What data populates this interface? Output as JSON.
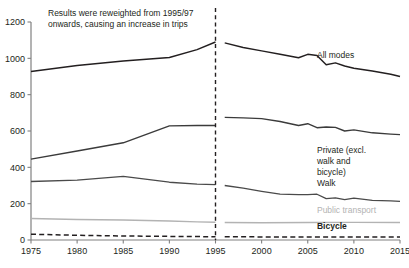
{
  "chart_data": {
    "type": "line",
    "title": "",
    "xlabel": "",
    "ylabel": "",
    "xlim": [
      1975,
      2015
    ],
    "ylim": [
      0,
      1200
    ],
    "grid": false,
    "legend_position": "inline-right",
    "yticks": [
      0,
      200,
      400,
      600,
      800,
      1000,
      1200
    ],
    "xticks": [
      1975,
      1980,
      1985,
      1990,
      1995,
      2000,
      2005,
      2010,
      2015
    ],
    "annotations": [
      {
        "name": "reweight-note",
        "line1": "Results were reweighted from 1995/97",
        "line2": "onwards, causing an increase in trips"
      },
      {
        "name": "series-break",
        "at_x": 1995,
        "style": "dashed-vertical"
      }
    ],
    "series": [
      {
        "name": "All modes",
        "color": "#231f20",
        "width": 1.5,
        "dash": "",
        "label_x": 2006,
        "label_y": 1000,
        "segments": [
          {
            "part": "pre",
            "x": [
              1975,
              1980,
              1985,
              1990,
              1993,
              1995
            ],
            "values": [
              928,
              960,
              985,
              1005,
              1048,
              1090
            ]
          },
          {
            "part": "post",
            "x": [
              1996,
              1998,
              2000,
              2002,
              2004,
              2005,
              2006,
              2007,
              2008,
              2009,
              2010,
              2012,
              2014,
              2015
            ],
            "values": [
              1085,
              1060,
              1041,
              1022,
              1003,
              1022,
              1016,
              965,
              975,
              958,
              945,
              930,
              912,
              900
            ]
          }
        ]
      },
      {
        "name": "Private (excl. walk and bicycle)",
        "color": "#3b3b3b",
        "width": 1.4,
        "dash": "",
        "label_x": 2006,
        "label_y": 480,
        "label_lines": [
          "Private (excl.",
          "walk and",
          "bicycle)"
        ],
        "segments": [
          {
            "part": "pre",
            "x": [
              1975,
              1980,
              1985,
              1990,
              1993,
              1995
            ],
            "values": [
              445,
              490,
              535,
              628,
              630,
              630
            ]
          },
          {
            "part": "post",
            "x": [
              1996,
              1998,
              2000,
              2002,
              2004,
              2005,
              2006,
              2007,
              2008,
              2009,
              2010,
              2012,
              2014,
              2015
            ],
            "values": [
              675,
              672,
              668,
              652,
              630,
              640,
              618,
              622,
              620,
              600,
              606,
              590,
              583,
              580
            ]
          }
        ]
      },
      {
        "name": "Walk",
        "color": "#4a4a4a",
        "width": 1.3,
        "dash": "",
        "label_x": 2006,
        "label_y": 300,
        "segments": [
          {
            "part": "pre",
            "x": [
              1975,
              1980,
              1985,
              1990,
              1993,
              1995
            ],
            "values": [
              322,
              330,
              350,
              318,
              308,
              305
            ]
          },
          {
            "part": "post",
            "x": [
              1996,
              1998,
              2000,
              2002,
              2004,
              2005,
              2006,
              2007,
              2008,
              2009,
              2010,
              2012,
              2014,
              2015
            ],
            "values": [
              300,
              285,
              268,
              252,
              250,
              250,
              252,
              228,
              232,
              222,
              230,
              218,
              215,
              213
            ]
          }
        ]
      },
      {
        "name": "Public transport",
        "color": "#b3b3b3",
        "width": 1.4,
        "dash": "",
        "label_x": 2006,
        "label_y": 150,
        "segments": [
          {
            "part": "pre",
            "x": [
              1975,
              1980,
              1985,
              1990,
              1993,
              1995
            ],
            "values": [
              118,
              113,
              110,
              105,
              100,
              98
            ]
          },
          {
            "part": "post",
            "x": [
              1996,
              2000,
              2005,
              2010,
              2015
            ],
            "values": [
              96,
              95,
              96,
              97,
              96
            ]
          }
        ]
      },
      {
        "name": "Bicycle",
        "color": "#231f20",
        "width": 1.5,
        "dash": "5 3.2",
        "label_x": 2006,
        "label_y": 62,
        "segments": [
          {
            "part": "pre",
            "x": [
              1975,
              1980,
              1985,
              1990,
              1995
            ],
            "values": [
              32,
              26,
              22,
              20,
              18
            ]
          },
          {
            "part": "post",
            "x": [
              1996,
              2000,
              2005,
              2010,
              2015
            ],
            "values": [
              18,
              17,
              17,
              16,
              16
            ]
          }
        ]
      }
    ]
  }
}
